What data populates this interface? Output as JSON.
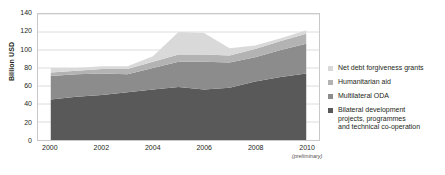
{
  "chart_data": {
    "type": "area",
    "stacked": true,
    "title": "",
    "xlabel": "",
    "ylabel": "Billion USD",
    "ylim": [
      0,
      140
    ],
    "ytick_values": [
      0,
      20,
      40,
      60,
      80,
      100,
      120,
      140
    ],
    "ytick_labels": [
      "0",
      "20",
      "40",
      "60",
      "80",
      "100",
      "120",
      "140"
    ],
    "xlim": [
      1999.5,
      2010.5
    ],
    "x": [
      2000,
      2001,
      2002,
      2003,
      2004,
      2005,
      2006,
      2007,
      2008,
      2009,
      2010
    ],
    "xtick_values": [
      2000,
      2002,
      2004,
      2006,
      2008,
      2010
    ],
    "xtick_labels": [
      "2000",
      "2002",
      "2004",
      "2006",
      "2008",
      "2010"
    ],
    "xtick_sublabel": "(preliminary)",
    "xtick_sublabel_at": 2010,
    "grid": "horizontal",
    "legend_position": "right",
    "series": [
      {
        "name": "Bilateral development projects, programmes and technical co-operation",
        "color": "#595959",
        "values": [
          45,
          48,
          50,
          53,
          56,
          59,
          56,
          58,
          65,
          70,
          74
        ]
      },
      {
        "name": "Multilateral ODA",
        "color": "#8c8c8c",
        "values": [
          26,
          25,
          24,
          20,
          24,
          28,
          31,
          28,
          27,
          30,
          33
        ]
      },
      {
        "name": "Humanitarian aid",
        "color": "#b3b3b3",
        "values": [
          4,
          4,
          5,
          6,
          7,
          8,
          8,
          8,
          9,
          10,
          11
        ]
      },
      {
        "name": "Net debt forgiveness grants",
        "color": "#d9d9d9",
        "values": [
          5,
          3,
          3,
          3,
          6,
          25,
          24,
          8,
          4,
          3,
          4
        ]
      }
    ],
    "totals": [
      80,
      80,
      82,
      82,
      93,
      120,
      119,
      102,
      105,
      113,
      122
    ]
  },
  "legend": {
    "items": [
      {
        "label_lines": [
          "Net debt forgiveness grants"
        ],
        "color": "#d9d9d9"
      },
      {
        "label_lines": [
          "Humanitarian aid"
        ],
        "color": "#b3b3b3"
      },
      {
        "label_lines": [
          "Multilateral ODA"
        ],
        "color": "#8c8c8c"
      },
      {
        "label_lines": [
          "Bilateral development",
          "projects, programmes",
          "and technical co-operation"
        ],
        "color": "#595959"
      }
    ]
  }
}
